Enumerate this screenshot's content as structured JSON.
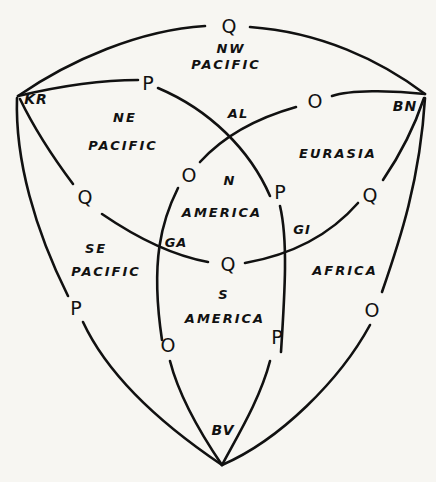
{
  "diagram": {
    "vertices": {
      "kr": "KR",
      "bn": "BN",
      "bv": "BV"
    },
    "junctions": {
      "al": "AL",
      "ga": "GA",
      "gi": "GI"
    },
    "boundary_nodes": [
      {
        "id": "top",
        "label": "Q"
      },
      {
        "id": "upper-p",
        "label": "P"
      },
      {
        "id": "upper-o",
        "label": "O"
      },
      {
        "id": "left-q",
        "label": "Q"
      },
      {
        "id": "center-o",
        "label": "O"
      },
      {
        "id": "center-p",
        "label": "P"
      },
      {
        "id": "right-q",
        "label": "Q"
      },
      {
        "id": "center-q",
        "label": "Q"
      },
      {
        "id": "left-p",
        "label": "P"
      },
      {
        "id": "right-o",
        "label": "O"
      },
      {
        "id": "lower-o",
        "label": "O"
      },
      {
        "id": "lower-p",
        "label": "P"
      }
    ],
    "regions": [
      {
        "id": "nw-pacific",
        "line1": "NW",
        "line2": "PACIFIC"
      },
      {
        "id": "ne-pacific",
        "line1": "NE",
        "line2": "PACIFIC"
      },
      {
        "id": "eurasia",
        "line1": "EURASIA",
        "line2": ""
      },
      {
        "id": "n-america",
        "line1": "N",
        "line2": "AMERICA"
      },
      {
        "id": "se-pacific",
        "line1": "SE",
        "line2": "PACIFIC"
      },
      {
        "id": "africa",
        "line1": "AFRICA",
        "line2": ""
      },
      {
        "id": "s-america",
        "line1": "S",
        "line2": "AMERICA"
      }
    ]
  }
}
